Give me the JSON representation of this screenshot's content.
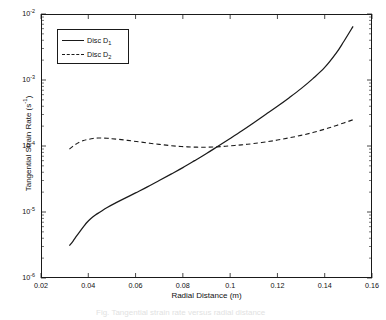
{
  "figure": {
    "background_color": "#ffffff",
    "axis_color": "#1a1a1a",
    "series_color": "#1a1a1a"
  },
  "caption": {
    "text": "Fig.  Tangential strain rate versus radial distance"
  },
  "legend": {
    "entries": [
      {
        "label_prefix": "Disc D",
        "label_sub": "1",
        "style": "solid"
      },
      {
        "label_prefix": "Disc D",
        "label_sub": "2",
        "style": "dashed"
      }
    ]
  },
  "chart_data": {
    "type": "line",
    "title": "",
    "xlabel": "Radial Distance (m)",
    "ylabel_prefix": "Tangential Strain Rate (s",
    "ylabel_sup": "-1",
    "ylabel_suffix": ")",
    "xscale": "linear",
    "yscale": "log",
    "xlim": [
      0.02,
      0.16
    ],
    "ylim": [
      1e-06,
      0.01
    ],
    "grid": false,
    "legend_position": "upper left",
    "xticks": [
      0.02,
      0.04,
      0.06,
      0.08,
      0.1,
      0.12,
      0.14,
      0.16
    ],
    "xticklabels": [
      "0.02",
      "0.04",
      "0.06",
      "0.08",
      "0.1",
      "0.12",
      "0.14",
      "0.16"
    ],
    "yticks": [
      0.01,
      0.001,
      0.0001,
      1e-05,
      1e-06
    ],
    "yticklabels": [
      "10",
      "10",
      "10",
      "10",
      "10"
    ],
    "ytick_exponents": [
      "-2",
      "-3",
      "-4",
      "-5",
      "-6"
    ],
    "series": [
      {
        "name": "Disc D1",
        "style": "solid",
        "x": [
          0.032,
          0.0335,
          0.035,
          0.0365,
          0.038,
          0.0395,
          0.041,
          0.043,
          0.045,
          0.048,
          0.052,
          0.056,
          0.06,
          0.065,
          0.07,
          0.075,
          0.08,
          0.085,
          0.09,
          0.095,
          0.1,
          0.105,
          0.11,
          0.115,
          0.12,
          0.125,
          0.13,
          0.135,
          0.14,
          0.145,
          0.148,
          0.152
        ],
        "y": [
          3.1e-06,
          3.6e-06,
          4.3e-06,
          5.1e-06,
          6e-06,
          7e-06,
          7.9e-06,
          9e-06,
          1e-05,
          1.17e-05,
          1.4e-05,
          1.65e-05,
          1.95e-05,
          2.4e-05,
          3e-05,
          3.75e-05,
          4.7e-05,
          6e-05,
          7.7e-05,
          0.0001,
          0.00013,
          0.00017,
          0.000225,
          0.0003,
          0.0004,
          0.00054,
          0.00074,
          0.00105,
          0.00155,
          0.0026,
          0.0038,
          0.0065
        ]
      },
      {
        "name": "Disc D2",
        "style": "dashed",
        "x": [
          0.032,
          0.034,
          0.036,
          0.038,
          0.04,
          0.042,
          0.044,
          0.046,
          0.048,
          0.05,
          0.054,
          0.058,
          0.062,
          0.066,
          0.07,
          0.074,
          0.078,
          0.082,
          0.086,
          0.09,
          0.094,
          0.098,
          0.102,
          0.106,
          0.11,
          0.115,
          0.12,
          0.125,
          0.13,
          0.135,
          0.14,
          0.145,
          0.152
        ],
        "y": [
          9e-05,
          0.000102,
          0.000113,
          0.000121,
          0.000126,
          0.00013,
          0.000132,
          0.000132,
          0.000131,
          0.000129,
          0.000125,
          0.00012,
          0.000115,
          0.00011,
          0.000106,
          0.000102,
          9.9e-05,
          9.7e-05,
          9.6e-05,
          9.6e-05,
          9.7e-05,
          9.9e-05,
          0.000102,
          0.000105,
          0.000109,
          0.000115,
          0.000123,
          0.000133,
          0.000145,
          0.00016,
          0.00018,
          0.000205,
          0.00025
        ]
      }
    ]
  }
}
